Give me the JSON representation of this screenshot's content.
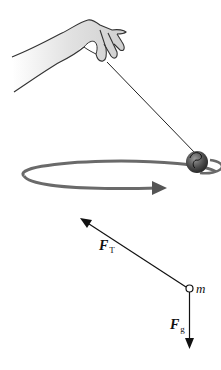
{
  "figure": {
    "labels": {
      "tension": {
        "symbol": "F",
        "subscript": "T"
      },
      "gravity": {
        "symbol": "F",
        "subscript": "g"
      },
      "mass": "m"
    },
    "icons": {
      "hand": "hand-icon",
      "ball": "ball-icon",
      "orbit": "circular-path-arrow"
    },
    "colors": {
      "ink": "#111111",
      "hand_fill": "#d9d9d9",
      "ball_fill": "#555555",
      "orbit_stroke": "#6a6a6a"
    }
  }
}
